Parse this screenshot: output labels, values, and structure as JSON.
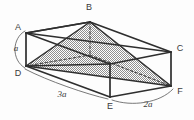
{
  "figure": {
    "background_color": "#fdfdfd",
    "line_color": "#333333",
    "shade_color": "#a8a8a8",
    "label_color": "#3a3a3a",
    "vertices": [
      {
        "id": "A",
        "label": "A",
        "x": 26,
        "y": 33,
        "label_x": 18,
        "label_y": 28,
        "hidden": false
      },
      {
        "id": "B",
        "label": "B",
        "x": 90,
        "y": 22,
        "label_x": 89,
        "label_y": 8,
        "hidden": false
      },
      {
        "id": "C",
        "label": "C",
        "x": 171,
        "y": 52,
        "label_x": 180,
        "label_y": 49,
        "hidden": false
      },
      {
        "id": "D",
        "label": "D",
        "x": 26,
        "y": 66,
        "label_x": 18,
        "label_y": 74,
        "hidden": false
      },
      {
        "id": "E",
        "label": "E",
        "x": 110,
        "y": 97,
        "label_x": 110,
        "label_y": 107,
        "hidden": false
      },
      {
        "id": "F",
        "label": "F",
        "x": 171,
        "y": 86,
        "label_x": 180,
        "label_y": 92,
        "hidden": false
      },
      {
        "id": "G",
        "label": "",
        "x": 90,
        "y": 55,
        "label_x": 90,
        "label_y": 55,
        "hidden": true
      },
      {
        "id": "H",
        "label": "",
        "x": 107,
        "y": 64,
        "label_x": 107,
        "label_y": 64,
        "hidden": true
      }
    ],
    "measurements": [
      {
        "id": "edge-AD",
        "label": "a",
        "x": 16,
        "y": 49,
        "describes": "vertical height A to D"
      },
      {
        "id": "edge-DE",
        "label": "3a",
        "x": 62,
        "y": 95,
        "describes": "length D to E"
      },
      {
        "id": "edge-EF",
        "label": "2a",
        "x": 148,
        "y": 105,
        "describes": "length E to F"
      }
    ],
    "shaded_region": {
      "name": "inscribed-pyramid",
      "apex": "B",
      "base": [
        "D",
        "E",
        "F"
      ]
    }
  }
}
